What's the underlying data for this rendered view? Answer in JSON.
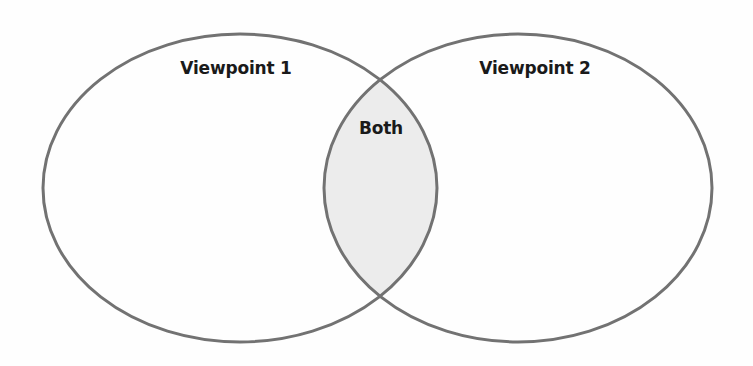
{
  "diagram": {
    "type": "venn",
    "sets": [
      {
        "id": "left",
        "label": "Viewpoint 1"
      },
      {
        "id": "right",
        "label": "Viewpoint 2"
      }
    ],
    "intersection": {
      "label": "Both"
    },
    "colors": {
      "stroke": "#727272",
      "intersection_fill": "#ececec",
      "background": "#fefefe",
      "text": "#1a1a1a"
    }
  }
}
